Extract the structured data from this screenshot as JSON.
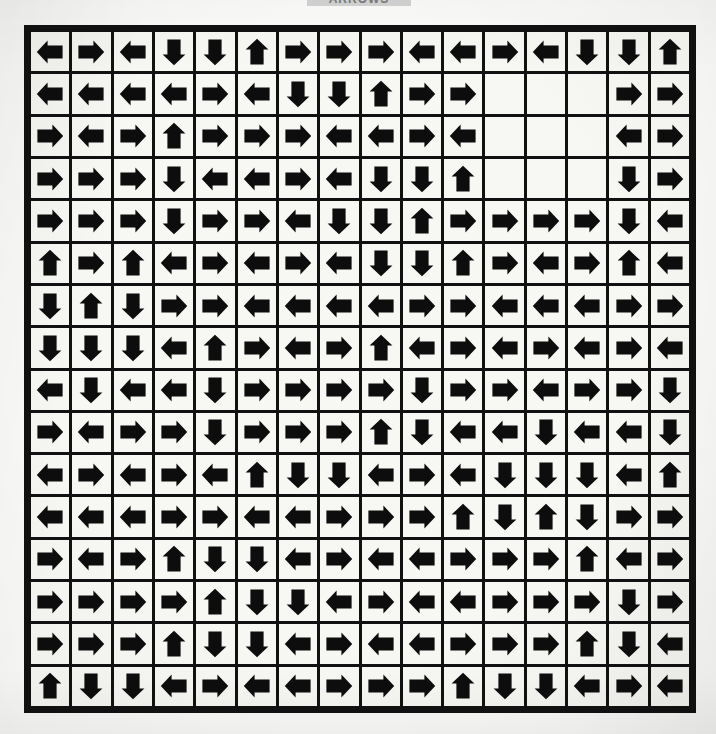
{
  "title": {
    "text": "ARROWS",
    "banner_color": "#d3d3d3"
  },
  "canvas": {
    "background_color": "#fbfbf9",
    "ink_color": "#0d0d0d",
    "cell_color": "#f7f7f4",
    "border_color": "#111111",
    "width": 716,
    "height": 734
  },
  "grid": {
    "rows": 16,
    "columns": 16,
    "total_cells": 256,
    "filled_cells": 247,
    "empty_cells": 9,
    "direction_legend": {
      "L": "arrow-left",
      "R": "arrow-right",
      "U": "arrow-up",
      "D": "arrow-down",
      "": "empty-cell"
    },
    "direction_counts": {
      "left": 79,
      "right": 101,
      "up": 27,
      "down": 40,
      "empty": 9
    },
    "cells": [
      [
        "L",
        "R",
        "L",
        "D",
        "D",
        "U",
        "R",
        "R",
        "R",
        "L",
        "L",
        "R",
        "L",
        "D",
        "D",
        "U"
      ],
      [
        "L",
        "L",
        "L",
        "L",
        "R",
        "L",
        "D",
        "D",
        "U",
        "R",
        "R",
        "",
        "",
        "",
        "R",
        "R"
      ],
      [
        "R",
        "L",
        "R",
        "U",
        "R",
        "R",
        "R",
        "L",
        "L",
        "R",
        "L",
        "",
        "",
        "",
        "L",
        "R"
      ],
      [
        "R",
        "R",
        "R",
        "D",
        "L",
        "L",
        "R",
        "L",
        "D",
        "D",
        "U",
        "",
        "",
        "",
        "D",
        "R"
      ],
      [
        "R",
        "R",
        "R",
        "D",
        "R",
        "R",
        "L",
        "D",
        "D",
        "U",
        "R",
        "R",
        "R",
        "R",
        "D",
        "L"
      ],
      [
        "U",
        "R",
        "U",
        "L",
        "R",
        "L",
        "R",
        "L",
        "D",
        "D",
        "U",
        "R",
        "L",
        "R",
        "U",
        "L"
      ],
      [
        "D",
        "U",
        "D",
        "R",
        "R",
        "L",
        "L",
        "L",
        "L",
        "R",
        "R",
        "L",
        "L",
        "L",
        "R",
        "R"
      ],
      [
        "D",
        "D",
        "D",
        "L",
        "U",
        "R",
        "L",
        "R",
        "U",
        "L",
        "R",
        "L",
        "R",
        "L",
        "R",
        "L"
      ],
      [
        "L",
        "D",
        "L",
        "L",
        "D",
        "R",
        "R",
        "R",
        "R",
        "D",
        "R",
        "R",
        "L",
        "R",
        "R",
        "D"
      ],
      [
        "R",
        "L",
        "R",
        "R",
        "D",
        "R",
        "R",
        "R",
        "U",
        "D",
        "L",
        "L",
        "D",
        "L",
        "L",
        "D"
      ],
      [
        "L",
        "R",
        "L",
        "R",
        "L",
        "U",
        "D",
        "D",
        "L",
        "R",
        "L",
        "D",
        "D",
        "D",
        "L",
        "U"
      ],
      [
        "L",
        "L",
        "L",
        "R",
        "R",
        "L",
        "L",
        "R",
        "R",
        "R",
        "U",
        "D",
        "U",
        "D",
        "R",
        "R"
      ],
      [
        "R",
        "L",
        "R",
        "U",
        "D",
        "D",
        "L",
        "R",
        "L",
        "L",
        "R",
        "R",
        "R",
        "U",
        "L",
        "R"
      ],
      [
        "R",
        "R",
        "R",
        "R",
        "U",
        "D",
        "D",
        "L",
        "R",
        "L",
        "L",
        "R",
        "R",
        "R",
        "D",
        "R"
      ],
      [
        "R",
        "R",
        "R",
        "U",
        "D",
        "D",
        "L",
        "R",
        "L",
        "L",
        "R",
        "R",
        "R",
        "U",
        "D",
        "L"
      ],
      [
        "U",
        "D",
        "D",
        "L",
        "R",
        "L",
        "L",
        "R",
        "R",
        "R",
        "U",
        "D",
        "D",
        "L",
        "R",
        "L"
      ]
    ]
  }
}
